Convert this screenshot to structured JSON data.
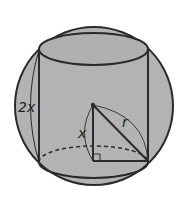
{
  "diagram": {
    "labels": {
      "height": "2x",
      "half_height": "x",
      "radius": "r"
    },
    "colors": {
      "sphere_fill": "#b4b4b4",
      "stroke": "#2a2a2a",
      "background": "#ffffff"
    },
    "shapes": [
      "sphere",
      "cylinder",
      "right-triangle"
    ]
  }
}
